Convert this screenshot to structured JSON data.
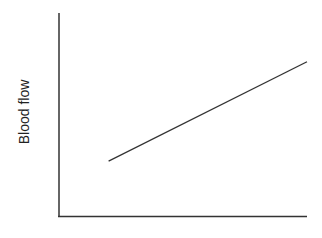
{
  "chart_data": {
    "type": "line",
    "title": "",
    "xlabel": "",
    "ylabel": "Blood flow",
    "grid": false,
    "legend": null,
    "x": [
      0.2,
      1.0
    ],
    "series": [
      {
        "name": "Blood flow",
        "values": [
          0.27,
          0.76
        ]
      }
    ],
    "xlim": [
      0,
      1
    ],
    "ylim": [
      0,
      1
    ],
    "tick_labels": {
      "x": [],
      "y": []
    }
  },
  "colors": {
    "axis": "#333333",
    "line": "#333333",
    "background": "#ffffff"
  }
}
